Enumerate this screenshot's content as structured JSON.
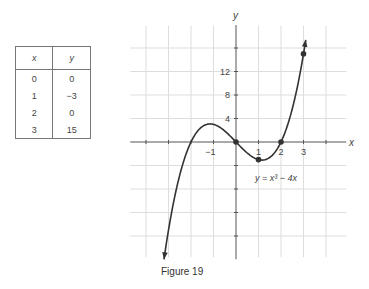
{
  "table": {
    "headers": [
      "x",
      "y"
    ],
    "rows": [
      [
        "0",
        "0"
      ],
      [
        "1",
        "−3"
      ],
      [
        "2",
        "0"
      ],
      [
        "3",
        "15"
      ]
    ]
  },
  "caption": "Figure 19",
  "chart_data": {
    "type": "line",
    "title": "",
    "equation": "y = x³ − 4x",
    "xlabel": "x",
    "ylabel": "y",
    "x_ticks": [
      {
        "v": -1,
        "label": "−1"
      },
      {
        "v": 1,
        "label": "1"
      },
      {
        "v": 2,
        "label": "2"
      },
      {
        "v": 3,
        "label": "3"
      }
    ],
    "y_ticks": [
      {
        "v": 4,
        "label": "4"
      },
      {
        "v": 8,
        "label": "8"
      },
      {
        "v": 12,
        "label": "12"
      }
    ],
    "xlim": [
      -4.7,
      4.9
    ],
    "ylim": [
      -19.6,
      19.8
    ],
    "grid": true,
    "grid_x_step": 1,
    "grid_y_step": 4,
    "curve_domain": [
      -3.2,
      3.1
    ],
    "points": [
      {
        "x": 0,
        "y": 0
      },
      {
        "x": 1,
        "y": -3
      },
      {
        "x": 2,
        "y": 0
      },
      {
        "x": 3,
        "y": 15
      }
    ],
    "colors": {
      "curve": "#333333",
      "grid": "#dddddd",
      "axis": "#555555"
    }
  }
}
